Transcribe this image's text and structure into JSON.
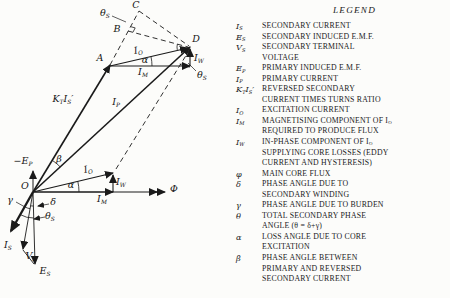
{
  "legend": {
    "title": "LEGEND",
    "entries": [
      {
        "id": "is",
        "symbol": "I_{S}",
        "lines": [
          "SECONDARY CURRENT"
        ]
      },
      {
        "id": "es",
        "symbol": "E_{S}",
        "lines": [
          "SECONDARY INDUCED E.M.F."
        ]
      },
      {
        "id": "vs",
        "symbol": "V_{S}",
        "lines": [
          "SECONDARY TERMINAL",
          "VOLTAGE"
        ]
      },
      {
        "id": "ep",
        "symbol": "E_{P}",
        "lines": [
          "PRIMARY INDUCED E.M.F."
        ]
      },
      {
        "id": "ip",
        "symbol": "I_{P}",
        "lines": [
          "PRIMARY CURRENT"
        ]
      },
      {
        "id": "ktis",
        "symbol": "K_{T}I_{S}′",
        "lines": [
          "REVERSED SECONDARY",
          "CURRENT TIMES TURNS RATIO"
        ]
      },
      {
        "id": "io",
        "symbol": "I_{O}",
        "lines": [
          "EXCITATION CURRENT"
        ]
      },
      {
        "id": "im",
        "symbol": "I_{M}",
        "lines": [
          "MAGNETISING COMPONENT OF I_{O}",
          "REQUIRED TO PRODUCE FLUX"
        ]
      },
      {
        "id": "iw",
        "symbol": "I_{W}",
        "lines": [
          "IN-PHASE COMPONENT OF I_{O}",
          "SUPPLYING CORE LOSSES (EDDY",
          "CURRENT AND HYSTERESIS)"
        ]
      },
      {
        "id": "phi",
        "symbol": "φ",
        "lines": [
          "MAIN CORE FLUX"
        ]
      },
      {
        "id": "delta",
        "symbol": "δ",
        "lines": [
          "PHASE ANGLE DUE TO",
          "SECONDARY WINDING"
        ]
      },
      {
        "id": "gamma",
        "symbol": "γ",
        "lines": [
          "PHASE ANGLE DUE TO BURDEN"
        ]
      },
      {
        "id": "theta",
        "symbol": "θ",
        "lines": [
          "TOTAL SECONDARY PHASE",
          "ANGLE (θ = δ+γ)"
        ]
      },
      {
        "id": "alpha",
        "symbol": "α",
        "lines": [
          "LOSS ANGLE DUE TO CORE",
          "EXCITATION"
        ]
      },
      {
        "id": "beta",
        "symbol": "β",
        "lines": [
          "PHASE ANGLE BETWEEN",
          "PRIMARY AND REVERSED",
          "SECONDARY CURRENT"
        ]
      }
    ]
  },
  "diagram": {
    "ink": "#1a1a1a",
    "points": {
      "O": [
        33,
        192
      ],
      "A": [
        110,
        65
      ],
      "B": [
        128,
        31
      ],
      "C": [
        139,
        11
      ],
      "D": [
        190,
        47
      ]
    },
    "vectors": [
      {
        "name": "phi-axis",
        "x1": 33,
        "y1": 192,
        "x2": 165,
        "y2": 192,
        "w": 1,
        "arrow": true
      },
      {
        "name": "phi-axis-chevron",
        "x1": 154,
        "y1": 192,
        "x2": 157,
        "y2": 192,
        "w": 1,
        "arrow": true
      },
      {
        "name": "neg-ep-axis",
        "x1": 33,
        "y1": 192,
        "x2": 33,
        "y2": 171,
        "w": 1,
        "arrow": true
      },
      {
        "name": "ktis-vector",
        "x1": 33,
        "y1": 192,
        "x2": 110,
        "y2": 65,
        "w": 1.6,
        "arrow": true
      },
      {
        "name": "ip-vector",
        "x1": 33,
        "y1": 192,
        "x2": 190,
        "y2": 47,
        "w": 1.6,
        "arrow": true
      },
      {
        "name": "io-vector-large",
        "x1": 110,
        "y1": 66,
        "x2": 188,
        "y2": 48,
        "w": 1.1,
        "arrow": true
      },
      {
        "name": "im-vector-large",
        "x1": 110,
        "y1": 66,
        "x2": 190,
        "y2": 66,
        "w": 1.1,
        "arrow": true
      },
      {
        "name": "iw-vector-large",
        "x1": 190,
        "y1": 66,
        "x2": 190,
        "y2": 49,
        "w": 1.1,
        "arrow": true
      },
      {
        "name": "io-vector-small",
        "x1": 33,
        "y1": 192,
        "x2": 113,
        "y2": 173,
        "w": 1.1,
        "arrow": true
      },
      {
        "name": "im-vector-small",
        "x1": 33,
        "y1": 192,
        "x2": 113,
        "y2": 192,
        "w": 1.1,
        "arrow": true
      },
      {
        "name": "iw-vector-small",
        "x1": 113,
        "y1": 192,
        "x2": 113,
        "y2": 175,
        "w": 1.1,
        "arrow": true
      },
      {
        "name": "is-vector",
        "x1": 33,
        "y1": 192,
        "x2": 11,
        "y2": 231,
        "w": 2.3,
        "arrow": true,
        "bigArrow": true
      },
      {
        "name": "es-vector",
        "x1": 33,
        "y1": 192,
        "x2": 35,
        "y2": 264,
        "w": 0.9,
        "arrow": true
      },
      {
        "name": "vs-vector",
        "x1": 33,
        "y1": 192,
        "x2": 23,
        "y2": 249,
        "w": 0.9,
        "arrow": true
      },
      {
        "name": "vs-es-connector",
        "x1": 23,
        "y1": 250,
        "x2": 34,
        "y2": 264,
        "w": 0.9,
        "arrow": false
      }
    ],
    "dashed": [
      {
        "name": "oa-extension-dashed",
        "x1": 110,
        "y1": 65,
        "x2": 139,
        "y2": 11
      },
      {
        "name": "bd-dashed",
        "x1": 128,
        "y1": 31,
        "x2": 188,
        "y2": 47
      },
      {
        "name": "cd-dashed",
        "x1": 139,
        "y1": 11,
        "x2": 189,
        "y2": 46
      },
      {
        "name": "d-parallelogram-dashed",
        "x1": 190,
        "y1": 49,
        "x2": 116,
        "y2": 169
      }
    ],
    "arcs": [
      {
        "name": "beta-arc",
        "d": "M52.2,160.3 A37,37 0 0 1 60.2,166.9"
      },
      {
        "name": "alpha-arc-small",
        "d": "M77.8,181.3 A46,46 0 0 1 79,192"
      },
      {
        "name": "alpha-arc-large",
        "d": "M151,56.8 A42,42 0 0 1 152,66"
      },
      {
        "name": "theta-s-arc-right",
        "d": "M190,67 A20,20 0 0 1 179.7,64.1"
      },
      {
        "name": "theta-s-arc-at-d",
        "d": "M177.3,49.9 A13,13 0 0 1 177.4,43.9"
      },
      {
        "name": "gamma-arc",
        "d": "M24.7,206.8 A17,17 0 0 0 30,208.7"
      },
      {
        "name": "delta-arc",
        "d": "M30.6,205.8 A14,14 0 0 0 33.4,206"
      },
      {
        "name": "theta-s-arc-bottom",
        "d": "M20.2,214.6 A26,26 0 0 0 33.7,218"
      }
    ],
    "marks": [
      {
        "name": "right-angle-mark-b",
        "type": "polyline",
        "pts": "130.4,26.6 135.2,27.9 132.9,32.3"
      },
      {
        "name": "theta-s-top-leader",
        "type": "line",
        "x1": 112,
        "y1": 16,
        "x2": 126,
        "y2": 22
      },
      {
        "name": "gamma-leader",
        "type": "line",
        "x1": 16,
        "y1": 202,
        "x2": 25,
        "y2": 207
      },
      {
        "name": "delta-leader",
        "type": "line",
        "x1": 49,
        "y1": 204,
        "x2": 38,
        "y2": 206,
        "arrow": true
      },
      {
        "name": "theta-s-bottom-leader",
        "type": "line",
        "x1": 45,
        "y1": 217,
        "x2": 34,
        "y2": 219,
        "arrow": true
      },
      {
        "name": "theta-s-right-leader",
        "type": "line",
        "x1": 196,
        "y1": 71,
        "x2": 188,
        "y2": 63
      }
    ],
    "labels": [
      {
        "name": "point-o",
        "text": "O",
        "x": 25,
        "y": 186
      },
      {
        "name": "point-a",
        "text": "A",
        "x": 100,
        "y": 58
      },
      {
        "name": "point-b",
        "text": "B",
        "x": 117,
        "y": 29
      },
      {
        "name": "point-c",
        "text": "C",
        "x": 136,
        "y": 5
      },
      {
        "name": "point-d",
        "text": "D",
        "x": 196,
        "y": 39
      },
      {
        "name": "theta-s-top",
        "text": "θ_{S}",
        "x": 105,
        "y": 13
      },
      {
        "name": "io-large",
        "text": "I_{O}",
        "x": 138,
        "y": 50,
        "rot": -11
      },
      {
        "name": "alpha-large",
        "text": "α",
        "x": 145,
        "y": 60
      },
      {
        "name": "iw-large",
        "text": "I_{W}",
        "x": 199,
        "y": 58
      },
      {
        "name": "im-large",
        "text": "I_{M}",
        "x": 143,
        "y": 72
      },
      {
        "name": "theta-s-right",
        "text": "θ_{S}",
        "x": 202,
        "y": 75
      },
      {
        "name": "ktis",
        "text": "K_{T}I_{S}′",
        "x": 63,
        "y": 99
      },
      {
        "name": "ip",
        "text": "I_{P}",
        "x": 116,
        "y": 102
      },
      {
        "name": "neg-ep",
        "text": "−E_{P}",
        "x": 23,
        "y": 161
      },
      {
        "name": "beta",
        "text": "β",
        "x": 59,
        "y": 159
      },
      {
        "name": "io-small",
        "text": "I_{O}",
        "x": 88,
        "y": 169,
        "rot": -12
      },
      {
        "name": "alpha-small",
        "text": "α",
        "x": 71,
        "y": 185
      },
      {
        "name": "iw-small",
        "text": "I_{W}",
        "x": 121,
        "y": 182
      },
      {
        "name": "im-small",
        "text": "I_{M}",
        "x": 102,
        "y": 199
      },
      {
        "name": "phi",
        "text": "Φ",
        "x": 174,
        "y": 189
      },
      {
        "name": "gamma",
        "text": "γ",
        "x": 10,
        "y": 200
      },
      {
        "name": "delta",
        "text": "δ",
        "x": 53,
        "y": 202
      },
      {
        "name": "theta-s-bottom",
        "text": "θ_{S}",
        "x": 50,
        "y": 216
      },
      {
        "name": "is",
        "text": "I_{S}",
        "x": 8,
        "y": 245
      },
      {
        "name": "vs",
        "text": "V_{S}",
        "x": 31,
        "y": 256
      },
      {
        "name": "es",
        "text": "E_{S}",
        "x": 45,
        "y": 271
      }
    ]
  }
}
